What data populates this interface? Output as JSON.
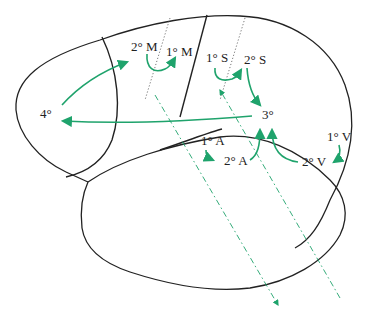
{
  "diagram": {
    "type": "brain-lateral-view-information-flow",
    "accent_color": "#1fa36c",
    "labels": {
      "quaternary": "4°",
      "secondary_motor": "2° M",
      "primary_motor": "1° M",
      "primary_somatosensory": "1° S",
      "secondary_somatosensory": "2° S",
      "tertiary": "3°",
      "primary_auditory": "1° A",
      "secondary_auditory": "2° A",
      "primary_visual": "1° V",
      "secondary_visual": "2° V"
    },
    "flows": [
      {
        "from": "4°",
        "to": "2° M"
      },
      {
        "from": "2° M",
        "to": "1° M"
      },
      {
        "from": "1° S",
        "to": "2° S"
      },
      {
        "from": "2° S",
        "to": "3°"
      },
      {
        "from": "1° A",
        "to": "2° A"
      },
      {
        "from": "2° A",
        "to": "3°"
      },
      {
        "from": "1° V",
        "to": "2° V"
      },
      {
        "from": "2° V",
        "to": "3°"
      },
      {
        "from": "3°",
        "to": "4°"
      }
    ]
  }
}
